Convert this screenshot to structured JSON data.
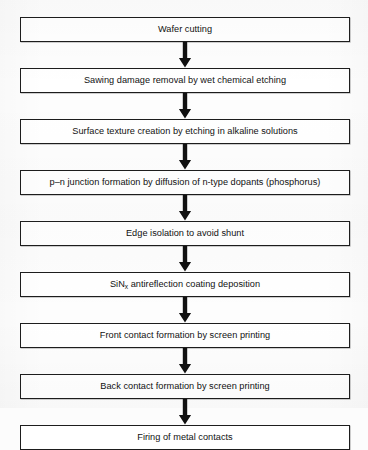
{
  "diagram": {
    "type": "flowchart",
    "orientation": "vertical",
    "colors": {
      "background": "#fdfdfd",
      "box_fill": "#ffffff",
      "box_border": "#1d1d1d",
      "text": "#111111",
      "arrow": "#111111"
    },
    "steps": [
      {
        "id": "step-1",
        "label": "Wafer cutting"
      },
      {
        "id": "step-2",
        "label": "Sawing damage removal by wet chemical etching"
      },
      {
        "id": "step-3",
        "label": "Surface texture creation by etching in alkaline solutions"
      },
      {
        "id": "step-4",
        "label": "p–n junction formation by diffusion of n-type dopants (phosphorus)"
      },
      {
        "id": "step-5",
        "label": "Edge isolation to avoid shunt"
      },
      {
        "id": "step-6",
        "label": "SiN",
        "label_sub": "x",
        "label_tail": " antireflection coating deposition"
      },
      {
        "id": "step-7",
        "label": "Front contact formation by screen printing"
      },
      {
        "id": "step-8",
        "label": "Back contact formation by screen printing"
      },
      {
        "id": "step-9",
        "label": "Firing of metal contacts"
      }
    ],
    "connectors": [
      {
        "id": "arrow-1",
        "from": "step-1",
        "to": "step-2",
        "icon": "arrow-down-icon"
      },
      {
        "id": "arrow-2",
        "from": "step-2",
        "to": "step-3",
        "icon": "arrow-down-icon"
      },
      {
        "id": "arrow-3",
        "from": "step-3",
        "to": "step-4",
        "icon": "arrow-down-icon"
      },
      {
        "id": "arrow-4",
        "from": "step-4",
        "to": "step-5",
        "icon": "arrow-down-icon"
      },
      {
        "id": "arrow-5",
        "from": "step-5",
        "to": "step-6",
        "icon": "arrow-down-icon"
      },
      {
        "id": "arrow-6",
        "from": "step-6",
        "to": "step-7",
        "icon": "arrow-down-icon"
      },
      {
        "id": "arrow-7",
        "from": "step-7",
        "to": "step-8",
        "icon": "arrow-down-icon"
      },
      {
        "id": "arrow-8",
        "from": "step-8",
        "to": "step-9",
        "icon": "arrow-down-icon"
      }
    ]
  }
}
